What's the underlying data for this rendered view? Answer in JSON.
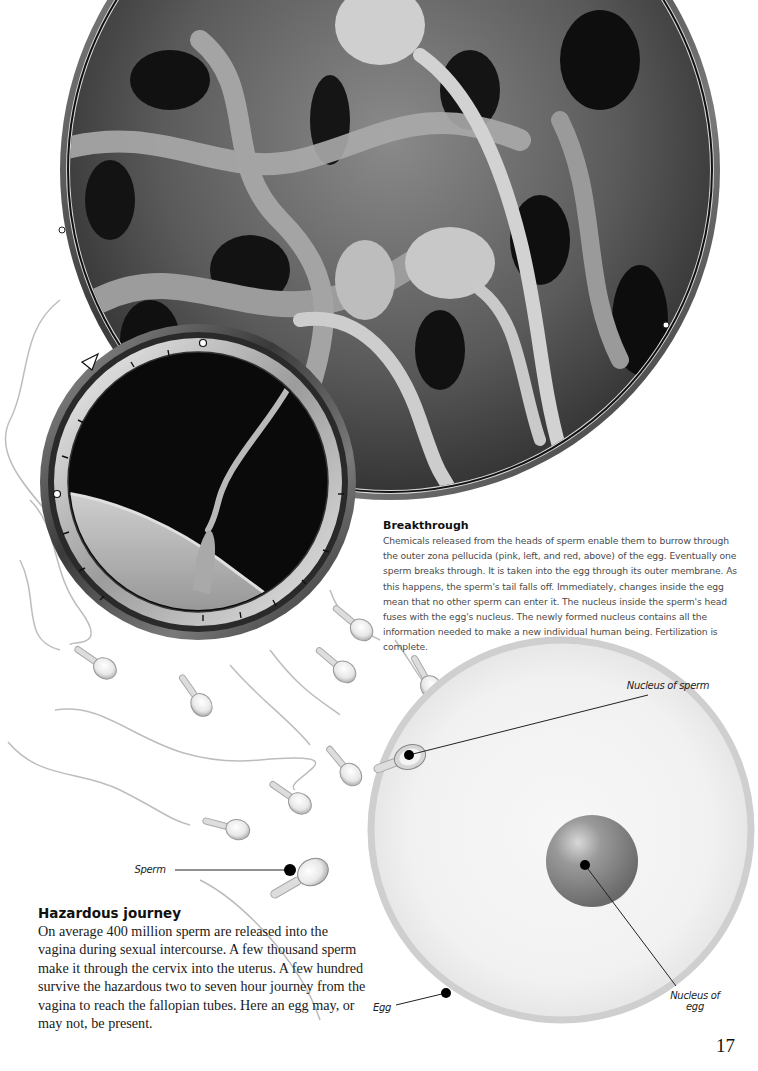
{
  "page": {
    "number": "17"
  },
  "images": {
    "large_micrograph": {
      "description": "Scanning electron micrograph of sperm on egg surface",
      "shape": "circle-lens"
    },
    "small_micrograph": {
      "description": "Micrograph of a sperm penetrating the zona pellucida",
      "shape": "circle-lens-with-dial"
    },
    "illustration": {
      "description": "Drawing of sperm swimming toward an egg"
    }
  },
  "breakthrough": {
    "heading": "Breakthrough",
    "body": "Chemicals released from the heads of sperm enable them to burrow through the outer zona pellucida (pink, left, and red, above) of the egg. Eventually one sperm breaks through. It is taken into the egg through its outer membrane. As this happens, the sperm's tail falls off. Immediately, changes inside the egg mean that no other sperm can enter it. The nucleus inside the sperm's head fuses with the egg's nucleus. The newly formed nucleus contains all the information needed to make a new individual human being. Fertilization is complete."
  },
  "hazardous_journey": {
    "heading": "Hazardous journey",
    "body": "On average 400 million sperm are released into the vagina during sexual intercourse. A few thousand sperm make it through the cervix into the uterus. A few hundred survive the hazardous two to seven hour journey from the vagina to reach the fallopian tubes. Here an egg may, or may not, be present."
  },
  "labels": {
    "nucleus_of_sperm": "Nucleus of sperm",
    "sperm": "Sperm",
    "egg": "Egg",
    "nucleus_of_egg": "Nucleus of egg"
  }
}
